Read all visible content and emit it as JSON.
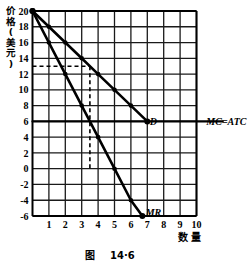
{
  "figure": {
    "caption_prefix": "图",
    "caption_number": "14·6",
    "ylabel_lines": [
      "价",
      "格",
      "(",
      "美",
      "元",
      ")"
    ],
    "ylabel_text": "价格(美元)",
    "xlabel_text": "数  量"
  },
  "chart_data": {
    "type": "line",
    "title": "",
    "xlabel": "数  量",
    "ylabel": "价格(美元)",
    "xlim": [
      0,
      10
    ],
    "ylim": [
      -6,
      20
    ],
    "grid": true,
    "legend": "inline-curve-labels",
    "xticks": [
      1,
      2,
      3,
      4,
      5,
      6,
      7,
      8,
      9,
      10
    ],
    "yticks": [
      20,
      18,
      16,
      14,
      12,
      10,
      8,
      6,
      4,
      2,
      0,
      -2,
      -4,
      -6
    ],
    "xtick_labels": [
      "1",
      "2",
      "3",
      "4",
      "5",
      "6",
      "7",
      "8",
      "9",
      "10"
    ],
    "ytick_labels": [
      "20",
      "18",
      "16",
      "14",
      "12",
      "10",
      "8",
      "6",
      "4",
      "2",
      "0",
      "-2",
      "-4",
      "-6"
    ],
    "series": [
      {
        "name": "D",
        "label": "D",
        "label_position": [
          7.15,
          6
        ],
        "markers": true,
        "x": [
          0,
          1,
          2,
          3,
          4,
          5,
          6,
          7
        ],
        "y": [
          20,
          18,
          16,
          14,
          12,
          10,
          8,
          6
        ]
      },
      {
        "name": "MR",
        "label": "MR",
        "label_position": [
          6.9,
          -5.6
        ],
        "markers": true,
        "x": [
          0,
          1,
          2,
          3,
          4,
          5,
          6,
          6.7
        ],
        "y": [
          20,
          16,
          12,
          8,
          4,
          0,
          -4,
          -6
        ]
      },
      {
        "name": "MC=ATC",
        "label": "MC=ATC",
        "label_position": [
          10.6,
          6
        ],
        "markers": false,
        "x": [
          0,
          11.6
        ],
        "y": [
          6,
          6
        ],
        "horizontal": true
      }
    ],
    "annotations": [
      {
        "name": "price-guide-horizontal",
        "style": "dashed",
        "from": [
          0,
          13
        ],
        "to": [
          3.5,
          13
        ]
      },
      {
        "name": "quantity-guide-vertical",
        "style": "dashed",
        "from": [
          3.5,
          13
        ],
        "to": [
          3.5,
          0
        ]
      }
    ]
  },
  "colors": {
    "ink": "#000000",
    "grid": "#1a1a1a",
    "background": "#ffffff"
  }
}
